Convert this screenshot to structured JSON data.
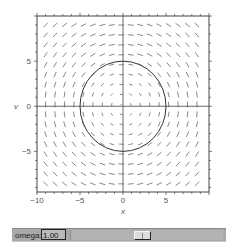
{
  "chart_data": {
    "type": "vector_field",
    "title": "",
    "xlabel": "x",
    "ylabel": "v",
    "xlim": [
      -10,
      10
    ],
    "ylim": [
      -9.5,
      10
    ],
    "x_ticks": [
      -10,
      -5,
      0,
      5
    ],
    "y_ticks": [
      -5,
      0,
      5
    ],
    "x_tick_labels": [
      "−10",
      "−5",
      "0",
      "5"
    ],
    "y_tick_labels": [
      "−5",
      "0",
      "5"
    ],
    "field": {
      "description": "Rotational (clockwise) vector field dx/dt = v, dv/dt = -omega^2 x",
      "grid_x_start": -9,
      "grid_x_step": 1.1,
      "grid_x_count": 17,
      "grid_y_start": -8.6,
      "grid_y_step": 1.1,
      "grid_y_count": 17,
      "segment_length_px": 6
    },
    "curves": [
      {
        "type": "circle",
        "center": [
          0,
          0
        ],
        "radius": 5
      }
    ],
    "axes_lines": {
      "x0": true,
      "y0": true
    },
    "grid": false,
    "frame_color": "#444444",
    "field_color": "#555555",
    "curve_color": "#333333"
  },
  "controls": {
    "slider_label": "omega:",
    "slider_value": "1.00",
    "slider_position_fraction": 0.46
  }
}
